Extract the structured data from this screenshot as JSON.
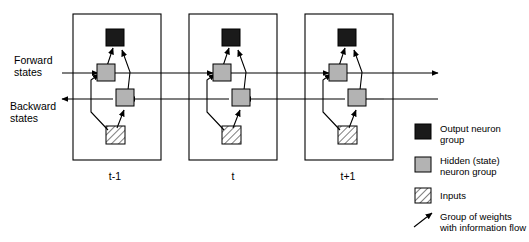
{
  "figure": {
    "type": "bidirectional-rnn-unfolded-diagram",
    "side_labels": [
      {
        "id": "forward-states",
        "line1": "Forward",
        "line2": "states"
      },
      {
        "id": "backward-states",
        "line1": "Backward",
        "line2": "states"
      }
    ],
    "time_steps": [
      {
        "id": "t-minus-1",
        "label": "t-1"
      },
      {
        "id": "t",
        "label": "t"
      },
      {
        "id": "t-plus-1",
        "label": "t+1"
      }
    ],
    "node_types": {
      "output": "Output neuron group",
      "hidden": "Hidden (state) neuron group",
      "input": "Inputs"
    }
  },
  "legend": {
    "items": [
      {
        "key": "output-neuron-group",
        "swatch": "black-square",
        "line1": "Output neuron",
        "line2": "group"
      },
      {
        "key": "hidden-state-neuron-group",
        "swatch": "gray-square",
        "line1": "Hidden (state)",
        "line2": "neuron group"
      },
      {
        "key": "inputs",
        "swatch": "hatched-square",
        "line1": "Inputs",
        "line2": ""
      },
      {
        "key": "group-of-weights",
        "swatch": "arrow",
        "line1": "Group of weights",
        "line2": "with information flow"
      }
    ]
  },
  "colors": {
    "output_fill": "#1a1a1a",
    "hidden_fill": "#b3b3b3",
    "input_fill": "#ffffff",
    "stroke": "#000000",
    "background": "#ffffff"
  }
}
